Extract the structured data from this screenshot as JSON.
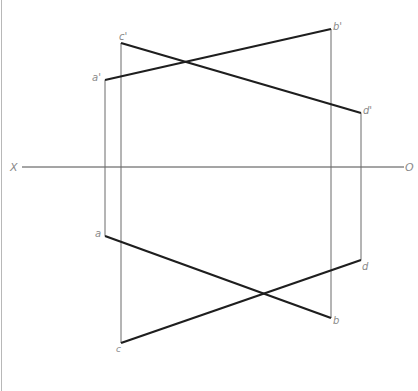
{
  "diagram": {
    "title": "",
    "type": "orthographic projection of two line segments (AB and CD)",
    "axis": {
      "left_label": "X",
      "right_label": "O",
      "y": 167,
      "x_start": 22,
      "x_end": 404
    },
    "colors": {
      "object_line": "#1e1e1e",
      "projector_line": "#6a6a6a",
      "axis_line": "#4a4a4a",
      "label": "#8a8a8a",
      "frame": "#b8b8b8"
    },
    "front_view": {
      "points": [
        {
          "name": "a'",
          "x": 105,
          "y": 80
        },
        {
          "name": "b'",
          "x": 331,
          "y": 29
        },
        {
          "name": "c'",
          "x": 121,
          "y": 43
        },
        {
          "name": "d'",
          "x": 361,
          "y": 113
        }
      ],
      "segments": [
        {
          "name": "a'b'",
          "from": "a'",
          "to": "b'"
        },
        {
          "name": "c'd'",
          "from": "c'",
          "to": "d'"
        }
      ]
    },
    "top_view": {
      "points": [
        {
          "name": "a",
          "x": 105,
          "y": 236
        },
        {
          "name": "b",
          "x": 331,
          "y": 318
        },
        {
          "name": "c",
          "x": 121,
          "y": 343
        },
        {
          "name": "d",
          "x": 361,
          "y": 260
        }
      ],
      "segments": [
        {
          "name": "ab",
          "from": "a",
          "to": "b"
        },
        {
          "name": "cd",
          "from": "c",
          "to": "d"
        }
      ]
    },
    "projectors": [
      {
        "name": "a-projector",
        "x": 105,
        "y1": 80,
        "y2": 236
      },
      {
        "name": "b-projector",
        "x": 331,
        "y1": 29,
        "y2": 318
      },
      {
        "name": "c-projector",
        "x": 121,
        "y1": 43,
        "y2": 343
      },
      {
        "name": "d-projector",
        "x": 361,
        "y1": 113,
        "y2": 260
      }
    ],
    "labels": {
      "a_prime": "a'",
      "b_prime": "b'",
      "c_prime": "c'",
      "d_prime": "d'",
      "a": "a",
      "b": "b",
      "c": "c",
      "d": "d",
      "x_axis": "X",
      "o_axis": "O"
    }
  }
}
